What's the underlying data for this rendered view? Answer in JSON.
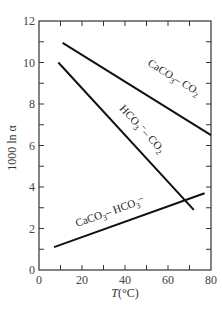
{
  "chart_data": {
    "type": "line",
    "title": "",
    "xlabel": "T(°C)",
    "ylabel": "1000 ln α",
    "xlim": [
      0,
      80
    ],
    "ylim": [
      0,
      12
    ],
    "xticks": [
      0,
      20,
      40,
      60,
      80
    ],
    "xtick_labels": [
      "0",
      "20",
      "40",
      "60",
      "80"
    ],
    "xminor": [
      10,
      30,
      50,
      70
    ],
    "yticks": [
      0,
      2,
      4,
      6,
      8,
      10,
      12
    ],
    "ytick_labels": [
      "0",
      "2",
      "4",
      "6",
      "8",
      "10",
      "12"
    ],
    "yminor": [
      1,
      3,
      5,
      7,
      9,
      11
    ],
    "grid": false,
    "legend": "none (inline labels)",
    "series": [
      {
        "name": "CaCO3–CO2",
        "label_parts": [
          "CaCO",
          "3",
          "– CO",
          "2"
        ],
        "x": [
          11,
          80
        ],
        "y": [
          10.95,
          6.5
        ]
      },
      {
        "name": "HCO3⁻–CO2",
        "label_parts": [
          "HCO",
          "3",
          "⁻– CO",
          "2"
        ],
        "x": [
          9,
          72
        ],
        "y": [
          10.0,
          2.9
        ]
      },
      {
        "name": "CaCO3–HCO3⁻",
        "label_parts": [
          "CaCO",
          "3",
          "– HCO",
          "3",
          "⁻"
        ],
        "x": [
          7,
          77
        ],
        "y": [
          1.1,
          3.7
        ]
      }
    ]
  }
}
